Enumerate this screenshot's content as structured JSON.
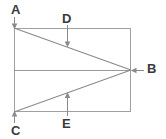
{
  "figure": {
    "type": "geometry-diagram",
    "canvas": {
      "width": 166,
      "height": 139,
      "background": "#ffffff"
    },
    "colors": {
      "line": "#9a9a9a",
      "diagonal": "#8a8a8a",
      "arrow": "#8a8a8a",
      "label_text": "#3a3a3a"
    },
    "vertices": {
      "rect_top_left": {
        "x": 14,
        "y": 28
      },
      "rect_top_right": {
        "x": 131,
        "y": 28
      },
      "rect_bottom_right": {
        "x": 131,
        "y": 112
      },
      "rect_bottom_left": {
        "x": 14,
        "y": 112
      },
      "point_b": {
        "x": 131,
        "y": 70
      },
      "mid_left": {
        "x": 14,
        "y": 70
      },
      "point_d_on_ab": {
        "x": 67,
        "y": 47
      },
      "point_e_on_cb": {
        "x": 67,
        "y": 93
      }
    },
    "labels": [
      {
        "id": "A",
        "text": "A",
        "x": 11,
        "y": 3,
        "target": "rect_top_left",
        "arrow": "down"
      },
      {
        "id": "D",
        "text": "D",
        "x": 62,
        "y": 12,
        "target": "point_d_on_ab",
        "arrow": "down"
      },
      {
        "id": "B",
        "text": "B",
        "x": 147,
        "y": 62,
        "target": "point_b",
        "arrow": "left"
      },
      {
        "id": "C",
        "text": "C",
        "x": 11,
        "y": 124,
        "target": "rect_bottom_left",
        "arrow": "up"
      },
      {
        "id": "E",
        "text": "E",
        "x": 62,
        "y": 117,
        "target": "point_e_on_cb",
        "arrow": "up"
      }
    ],
    "segments": [
      {
        "name": "rect-top-edge",
        "from": "rect_top_left",
        "to": "rect_top_right"
      },
      {
        "name": "rect-right-edge",
        "from": "rect_top_right",
        "to": "rect_bottom_right"
      },
      {
        "name": "rect-bottom-edge",
        "from": "rect_bottom_right",
        "to": "rect_bottom_left"
      },
      {
        "name": "rect-left-edge",
        "from": "rect_bottom_left",
        "to": "rect_top_left"
      },
      {
        "name": "midline",
        "from": "mid_left",
        "to": "point_b"
      },
      {
        "name": "diagonal-a-to-b",
        "from": "rect_top_left",
        "to": "point_b"
      },
      {
        "name": "diagonal-c-to-b",
        "from": "rect_bottom_left",
        "to": "point_b"
      }
    ]
  }
}
